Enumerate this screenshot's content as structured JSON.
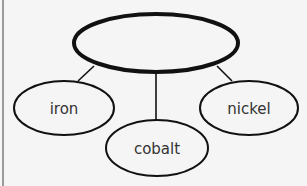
{
  "diagram": {
    "type": "concept-web",
    "central_node": {
      "label": ""
    },
    "child_nodes": [
      {
        "label": "iron"
      },
      {
        "label": "cobalt"
      },
      {
        "label": "nickel"
      }
    ]
  },
  "colors": {
    "background": "#f5f5f5",
    "stroke": "#111111",
    "text": "#333333",
    "frame": "#9a9a9a"
  }
}
